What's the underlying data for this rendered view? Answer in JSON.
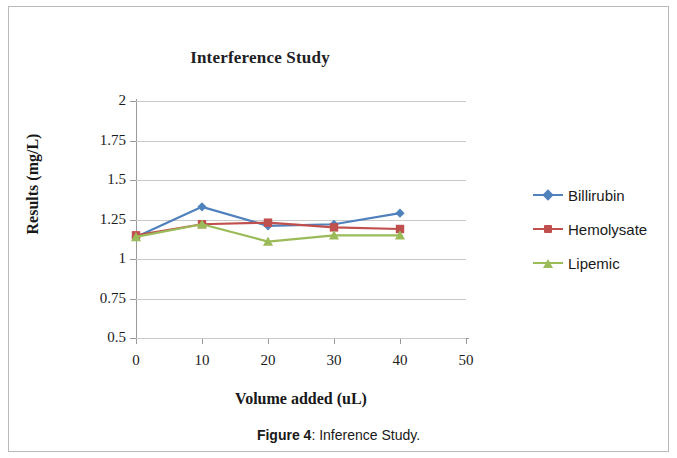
{
  "figure": {
    "caption_label": "Figure 4",
    "caption_separator": ": ",
    "caption_text": "Inference Study."
  },
  "legend": {
    "position": "right",
    "entries": [
      {
        "label": "Billirubin",
        "color": "#4f81bd",
        "marker": "diamond"
      },
      {
        "label": "Hemolysate",
        "color": "#c0504d",
        "marker": "square"
      },
      {
        "label": "Lipemic",
        "color": "#9bbb59",
        "marker": "triangle"
      }
    ]
  },
  "chart_data": {
    "type": "line",
    "title": "Interference Study",
    "xlabel": "Volume added (uL)",
    "ylabel": "Results (mg/L)",
    "x": [
      0,
      10,
      20,
      30,
      40
    ],
    "xlim": [
      0,
      50
    ],
    "ylim": [
      0.5,
      2
    ],
    "xticks": [
      0,
      10,
      20,
      30,
      40,
      50
    ],
    "yticks": [
      0.5,
      0.75,
      1,
      1.25,
      1.5,
      1.75,
      2
    ],
    "ytick_labels": [
      "0.5",
      "0.75",
      "1",
      "1.25",
      "1.5",
      "1.75",
      "2"
    ],
    "xtick_labels": [
      "0",
      "10",
      "20",
      "30",
      "40",
      "50"
    ],
    "grid": "horizontal",
    "series": [
      {
        "name": "Billirubin",
        "color": "#4f81bd",
        "marker": "diamond",
        "values": [
          1.14,
          1.33,
          1.21,
          1.22,
          1.29
        ]
      },
      {
        "name": "Hemolysate",
        "color": "#c0504d",
        "marker": "square",
        "values": [
          1.15,
          1.22,
          1.23,
          1.2,
          1.19
        ]
      },
      {
        "name": "Lipemic",
        "color": "#9bbb59",
        "marker": "triangle",
        "values": [
          1.14,
          1.22,
          1.11,
          1.15,
          1.15
        ]
      }
    ]
  }
}
